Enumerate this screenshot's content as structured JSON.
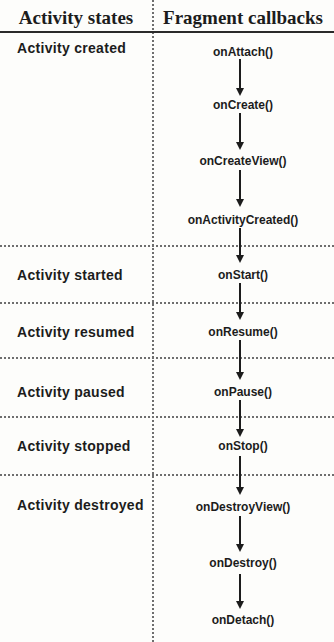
{
  "header": {
    "left": "Activity states",
    "right": "Fragment callbacks"
  },
  "states": [
    "Activity created",
    "Activity started",
    "Activity resumed",
    "Activity paused",
    "Activity stopped",
    "Activity destroyed"
  ],
  "callbacks": [
    "onAttach()",
    "onCreate()",
    "onCreateView()",
    "onActivityCreated()",
    "onStart()",
    "onResume()",
    "onPause()",
    "onStop()",
    "onDestroyView()",
    "onDestroy()",
    "onDetach()"
  ],
  "colors": {
    "text": "#1c1c1c",
    "background": "#fdfdfb",
    "divider": "#6e6e6e",
    "rule": "#2a2a2a"
  }
}
